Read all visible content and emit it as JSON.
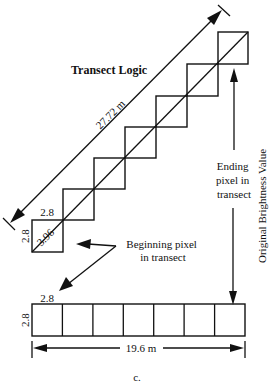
{
  "diagram": {
    "title": "Transect Logic",
    "diagonal_length_label": "27.72 m",
    "pixel_size_top_label": "2.8",
    "pixel_size_side_label": "2.8",
    "pixel_diagonal_label": "3.96",
    "ending_pixel_label": [
      "Ending",
      "pixel in",
      "transect"
    ],
    "beginning_pixel_label": [
      "Beginning pixel",
      "in transect"
    ],
    "y_axis_label": "Original Brightness Value",
    "row_pixel_top_label": "2.8",
    "row_pixel_side_label": "2.8",
    "row_length_label": "19.6 m",
    "caption": "c.",
    "staircase_pixel_count": 7,
    "row_pixel_count": 7
  }
}
